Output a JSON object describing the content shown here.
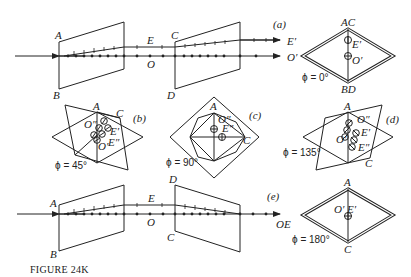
{
  "figure": {
    "caption": "FIGURE 24K",
    "panels": {
      "a": {
        "tag": "(a)",
        "crystal1_labels": {
          "top": "A",
          "bottom": "B"
        },
        "crystal2_labels": {
          "top": "C",
          "bottom": "D"
        },
        "ray_labels": {
          "e_mid": "E",
          "o_mid": "O",
          "e_out": "E′",
          "o_out": "O′"
        },
        "end_view": {
          "top": "AC",
          "bottom": "BD",
          "e_spot": "E′",
          "o_spot": "O′",
          "angle": "ϕ = 0°"
        }
      },
      "b": {
        "tag": "(b)",
        "labels": {
          "a": "A",
          "c": "C",
          "o2": "O″",
          "e2": "E″",
          "e1": "E′",
          "o1": "O′"
        },
        "angle": "ϕ = 45°"
      },
      "c": {
        "tag": "(c)",
        "labels": {
          "a": "A",
          "c": "C",
          "o2": "O″",
          "e2": "E″"
        },
        "angle": "ϕ = 90°"
      },
      "d": {
        "tag": "(d)",
        "labels": {
          "a": "A",
          "c": "C",
          "o2": "O″",
          "e1": "E′",
          "e2": "E″",
          "o1": "O′"
        },
        "angle": "ϕ = 135°"
      },
      "e": {
        "tag": "(e)",
        "crystal1_labels": {
          "top": "A",
          "bottom": "B"
        },
        "crystal2_labels": {
          "top": "D",
          "bottom": "C"
        },
        "ray_labels": {
          "e_mid": "E",
          "o_mid": "O",
          "out": "OE"
        },
        "end_view": {
          "top": "A",
          "bottom": "C",
          "spot": "O′ E′",
          "angle": "ϕ = 180°"
        }
      }
    }
  }
}
